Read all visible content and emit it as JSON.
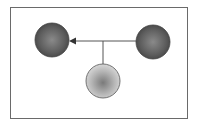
{
  "diagram": {
    "type": "node-link",
    "nodes": [
      {
        "id": "left",
        "shade": "dark",
        "color": "#5a5a5a"
      },
      {
        "id": "right",
        "shade": "dark",
        "color": "#5a5a5a"
      },
      {
        "id": "bottom",
        "shade": "light",
        "color": "#b0b0b0"
      }
    ],
    "edges": [
      {
        "from": "right",
        "to": "left",
        "arrow": "left"
      },
      {
        "from": "bottom",
        "to": "edge-junction"
      }
    ],
    "colors": {
      "frame": "#6a6a6a",
      "line": "#555555"
    }
  }
}
